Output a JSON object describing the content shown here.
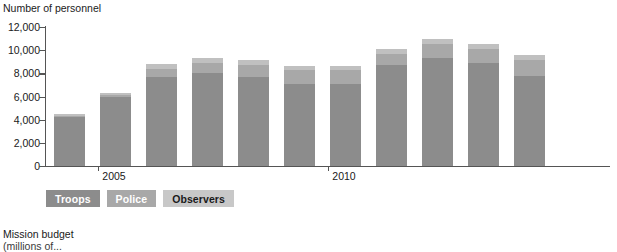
{
  "chart_data": {
    "type": "bar",
    "subtype": "stacked-bar",
    "title": "",
    "ylabel": "Number of personnel",
    "xlabel": "",
    "ylim": [
      0,
      12000
    ],
    "yticks": [
      0,
      2000,
      4000,
      6000,
      8000,
      10000,
      12000
    ],
    "ytick_labels": [
      "0",
      "2,000",
      "4,000",
      "6,000",
      "8,000",
      "10,000",
      "12,000"
    ],
    "grid": false,
    "legend_position": "below-axis-left",
    "categories": [
      "2004",
      "2005",
      "2006",
      "2007",
      "2008",
      "2009",
      "2010",
      "2011",
      "2012",
      "2013",
      "2014"
    ],
    "xtick_labels": [
      "2005",
      "2010"
    ],
    "xtick_categories": [
      "2005",
      "2010"
    ],
    "series": [
      {
        "name": "Troops",
        "color": "#8c8c8c",
        "values": [
          4200,
          5950,
          7650,
          8000,
          7650,
          7100,
          7100,
          8700,
          9300,
          8900,
          7800
        ]
      },
      {
        "name": "Police",
        "color": "#a8a8a8",
        "values": [
          150,
          180,
          750,
          900,
          1100,
          1150,
          1150,
          1000,
          1250,
          1200,
          1350
        ]
      },
      {
        "name": "Observers",
        "color": "#c0c0c0",
        "values": [
          150,
          170,
          400,
          400,
          400,
          350,
          350,
          400,
          450,
          400,
          400
        ]
      }
    ],
    "totals": [
      4500,
      6300,
      8800,
      9300,
      9150,
      8600,
      8600,
      10100,
      11000,
      10500,
      9550
    ]
  },
  "legend": {
    "items": [
      {
        "label": "Troops",
        "key": "troops"
      },
      {
        "label": "Police",
        "key": "police"
      },
      {
        "label": "Observers",
        "key": "observers"
      }
    ]
  },
  "footer": {
    "title": "Mission budget",
    "subtitle": "(millions of..."
  }
}
